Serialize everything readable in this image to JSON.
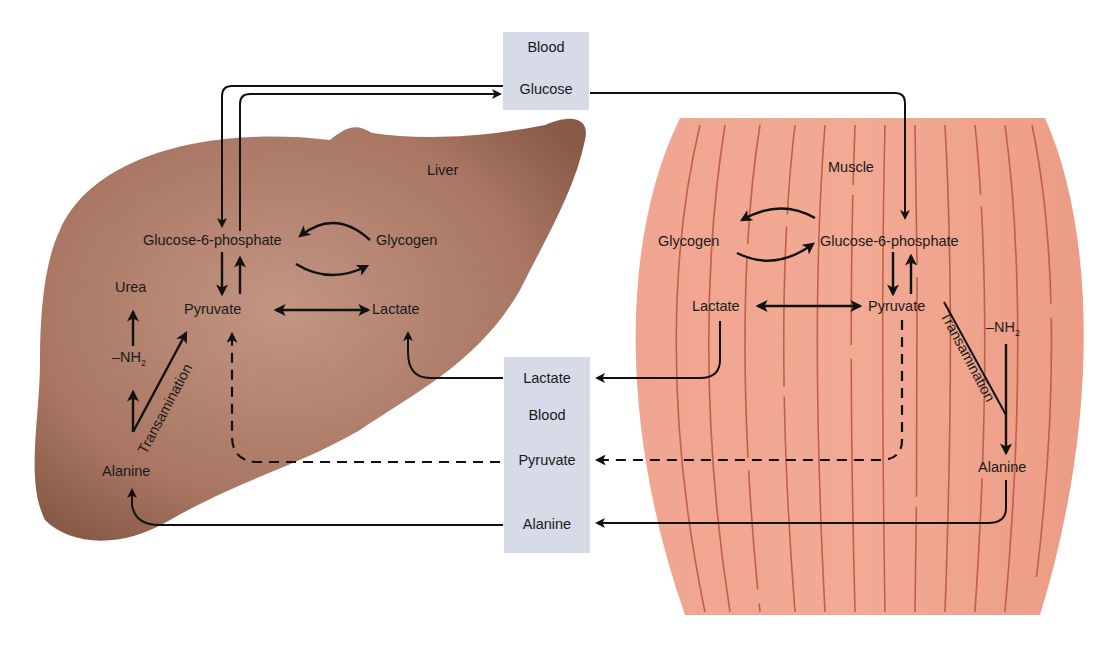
{
  "diagram": {
    "type": "Cori cycle and glucose-alanine cycle",
    "colors": {
      "liver_fill": "#a3705e",
      "liver_light": "#c0907e",
      "muscle_fill": "#eea08a",
      "muscle_fiber": "#b8543a",
      "blood_box": "#d7dbe8",
      "arrow": "#111111"
    },
    "blood_top": {
      "title": "Blood",
      "item": "Glucose"
    },
    "blood_bottom": {
      "title": "Blood",
      "items": [
        "Lactate",
        "Pyruvate",
        "Alanine"
      ]
    },
    "liver": {
      "title": "Liver",
      "nodes": {
        "g6p": "Glucose-6-phosphate",
        "glycogen": "Glycogen",
        "pyruvate": "Pyruvate",
        "lactate": "Lactate",
        "urea": "Urea",
        "nh2": "–NH",
        "nh2_sub": "2",
        "alanine": "Alanine",
        "transamination": "Transamination"
      }
    },
    "muscle": {
      "title": "Muscle",
      "nodes": {
        "g6p": "Glucose-6-phosphate",
        "glycogen": "Glycogen",
        "pyruvate": "Pyruvate",
        "lactate": "Lactate",
        "nh2": "–NH",
        "nh2_sub": "2",
        "alanine": "Alanine",
        "transamination": "Transamination"
      }
    }
  }
}
